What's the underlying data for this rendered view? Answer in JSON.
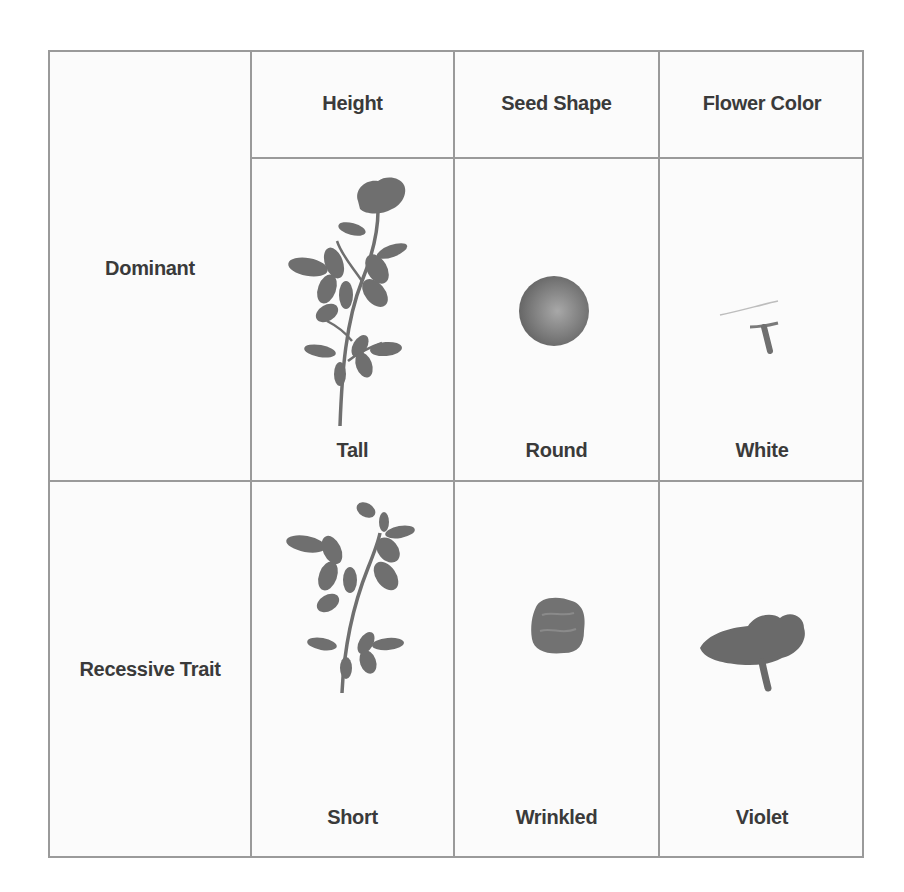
{
  "table": {
    "columns": [
      "",
      "Height",
      "Seed Shape",
      "Flower Color"
    ],
    "rows": [
      {
        "header": "Dominant",
        "cells": [
          {
            "trait": "Height",
            "value": "Tall",
            "icon": "tall-plant-icon"
          },
          {
            "trait": "Seed Shape",
            "value": "Round",
            "icon": "round-seed-icon"
          },
          {
            "trait": "Flower Color",
            "value": "White",
            "icon": "white-flower-icon"
          }
        ]
      },
      {
        "header": "Recessive Trait",
        "cells": [
          {
            "trait": "Height",
            "value": "Short",
            "icon": "short-plant-icon"
          },
          {
            "trait": "Seed Shape",
            "value": "Wrinkled",
            "icon": "wrinkled-seed-icon"
          },
          {
            "trait": "Flower Color",
            "value": "Violet",
            "icon": "violet-flower-icon"
          }
        ]
      }
    ]
  },
  "colors": {
    "border": "#9a9a9a",
    "text": "#3a3a3a",
    "illustration": "#6f6f6f"
  }
}
